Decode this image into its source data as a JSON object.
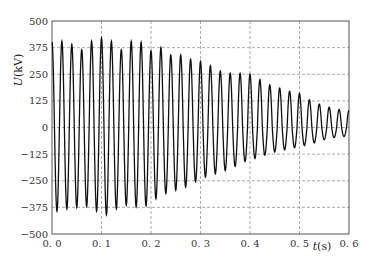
{
  "chart_data": {
    "type": "line",
    "title": "",
    "xlabel": "t(s)",
    "ylabel": "U(kV)",
    "xlim": [
      0.0,
      0.6
    ],
    "ylim": [
      -500,
      500
    ],
    "x_ticks": [
      "0.0",
      "0.1",
      "0.2",
      "0.3",
      "0.4",
      "0.5",
      "0.6"
    ],
    "y_ticks": [
      "500",
      "375",
      "250",
      "125",
      "0",
      "-125",
      "-250",
      "-375",
      "-500"
    ],
    "grid": true,
    "grid_style": "dashed",
    "legend": null,
    "frequency_hz": 50,
    "series": [
      {
        "name": "U",
        "color": "#111111",
        "description": "Decaying 50 Hz oscillation; peak envelope (t, +peak, -peak)",
        "peaks": [
          [
            0.0,
            400,
            -390
          ],
          [
            0.02,
            405,
            -395
          ],
          [
            0.04,
            390,
            -370
          ],
          [
            0.06,
            365,
            -380
          ],
          [
            0.08,
            405,
            -360
          ],
          [
            0.1,
            420,
            -425
          ],
          [
            0.12,
            405,
            -395
          ],
          [
            0.14,
            365,
            -370
          ],
          [
            0.16,
            405,
            -360
          ],
          [
            0.18,
            400,
            -385
          ],
          [
            0.2,
            360,
            -350
          ],
          [
            0.22,
            375,
            -320
          ],
          [
            0.24,
            340,
            -300
          ],
          [
            0.26,
            340,
            -290
          ],
          [
            0.28,
            320,
            -270
          ],
          [
            0.3,
            310,
            -240
          ],
          [
            0.32,
            290,
            -225
          ],
          [
            0.34,
            265,
            -210
          ],
          [
            0.36,
            255,
            -195
          ],
          [
            0.38,
            255,
            -170
          ],
          [
            0.4,
            250,
            -150
          ],
          [
            0.42,
            225,
            -140
          ],
          [
            0.44,
            200,
            -120
          ],
          [
            0.46,
            185,
            -110
          ],
          [
            0.48,
            170,
            -100
          ],
          [
            0.5,
            160,
            -90
          ],
          [
            0.52,
            130,
            -80
          ],
          [
            0.54,
            110,
            -65
          ],
          [
            0.56,
            95,
            -50
          ],
          [
            0.58,
            85,
            -45
          ],
          [
            0.6,
            80,
            -40
          ]
        ]
      }
    ]
  }
}
